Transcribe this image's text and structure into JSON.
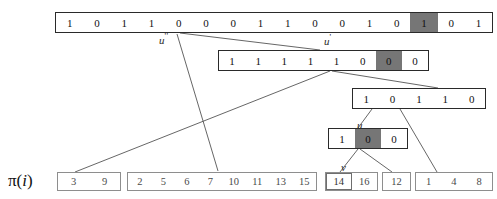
{
  "diagram": {
    "title_label": "π(i)",
    "pi_symbol": "π",
    "pi_open": "(",
    "pi_index": "i",
    "pi_close": ")",
    "colors": {
      "highlight": "#767676",
      "box_border": "#2a2a2a",
      "group_border": "#8e8e8e",
      "line": "#555555",
      "background": "#ffffff",
      "text": "#111111"
    },
    "bit_rows": [
      {
        "id": "row-root",
        "name": "root-bitvector",
        "bits": [
          "1",
          "0",
          "1",
          "1",
          "0",
          "0",
          "0",
          "1",
          "1",
          "0",
          "0",
          "1",
          "0",
          "1",
          "0",
          "1"
        ],
        "highlight_index": 13,
        "label": null
      },
      {
        "id": "row-u2",
        "name": "u-double-prime-bitvector",
        "bits": [
          "1",
          "1",
          "1",
          "1",
          "1",
          "0",
          "0",
          "0"
        ],
        "highlight_index": 6,
        "label": "u'"
      },
      {
        "id": "row-u1",
        "name": "u-prime-bitvector",
        "bits": [
          "1",
          "0",
          "1",
          "1",
          "0"
        ],
        "highlight_index": -1,
        "label": null
      },
      {
        "id": "row-u",
        "name": "u-bitvector",
        "bits": [
          "1",
          "0",
          "0"
        ],
        "highlight_index": 1,
        "label": "u"
      }
    ],
    "node_labels": [
      {
        "name": "label-u-double-prime",
        "base": "u",
        "primes": "''"
      },
      {
        "name": "label-u-prime",
        "base": "u",
        "primes": "'"
      },
      {
        "name": "label-u",
        "base": "u",
        "primes": ""
      },
      {
        "name": "label-v",
        "base": "v",
        "primes": ""
      }
    ],
    "leaf_groups": [
      {
        "name": "leaf-group-1",
        "values": [
          "3",
          "9"
        ],
        "boxed_index": -1
      },
      {
        "name": "leaf-group-2",
        "values": [
          "2",
          "5",
          "6",
          "7",
          "10",
          "11",
          "13",
          "15"
        ],
        "boxed_index": -1
      },
      {
        "name": "leaf-group-3",
        "values": [
          "14",
          "16"
        ],
        "boxed_index": 0
      },
      {
        "name": "leaf-group-4",
        "values": [
          "12"
        ],
        "boxed_index": -1
      },
      {
        "name": "leaf-group-5",
        "values": [
          "1",
          "4",
          "8"
        ],
        "boxed_index": -1
      }
    ]
  }
}
